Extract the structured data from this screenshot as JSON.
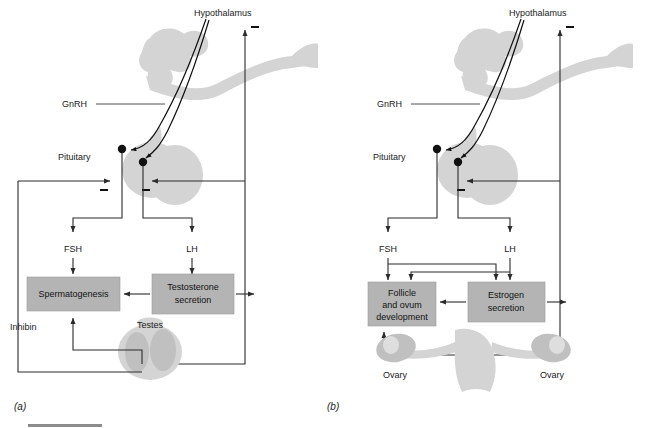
{
  "figure": {
    "type": "schematic-diagram",
    "panels": [
      {
        "id": "a",
        "label": "(a)",
        "subject": "male",
        "labels": {
          "hypothalamus": "Hypothalamus",
          "gnrh": "GnRH",
          "pituitary": "Pituitary",
          "fsh": "FSH",
          "lh": "LH",
          "inhibin": "Inhibin",
          "gonad": "Testes"
        },
        "boxes": [
          {
            "id": "spermatogenesis",
            "text": "Spermatogenesis"
          },
          {
            "id": "testosterone",
            "line1": "Testosterone",
            "line2": "secretion"
          }
        ],
        "feedback_signs": [
          "−",
          "−",
          "−"
        ]
      },
      {
        "id": "b",
        "label": "(b)",
        "subject": "female",
        "labels": {
          "hypothalamus": "Hypothalamus",
          "gnrh": "GnRH",
          "pituitary": "Pituitary",
          "fsh": "FSH",
          "lh": "LH",
          "gonad_left": "Ovary",
          "gonad_right": "Ovary"
        },
        "boxes": [
          {
            "id": "follicle",
            "line1": "Follicle",
            "line2": "and ovum",
            "line3": "development"
          },
          {
            "id": "estrogen",
            "line1": "Estrogen",
            "line2": "secretion"
          }
        ],
        "feedback_signs": [
          "−",
          "−",
          "−"
        ]
      }
    ],
    "colors": {
      "box_fill": "#b4b4b4",
      "organ_fill": "#d4d4d4",
      "organ_dark": "#c0c0c0",
      "line": "#2b2b2b",
      "text": "#1a1a1a",
      "background": "#ffffff"
    }
  }
}
